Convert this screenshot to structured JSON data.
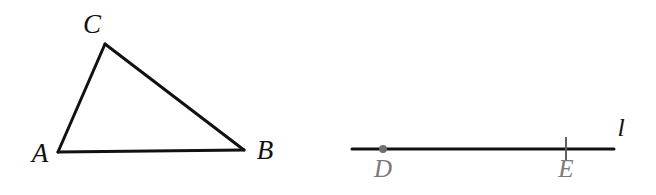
{
  "figure": {
    "caption": "Geometry figure: triangle ABC and line l with points D and E",
    "background_color": "#ffffff",
    "stroke_color": "#111111",
    "gray_color": "#7a7a7a",
    "triangle": {
      "name": "triangle-abc",
      "stroke_width": 3,
      "vertices": [
        {
          "label": "A",
          "x": 58,
          "y": 152,
          "label_x": 40,
          "label_y": 156
        },
        {
          "label": "B",
          "x": 244,
          "y": 150,
          "label_x": 265,
          "label_y": 153
        },
        {
          "label": "C",
          "x": 105,
          "y": 44,
          "label_x": 92,
          "label_y": 27
        }
      ],
      "edges": [
        {
          "name": "segment-ca",
          "from": "C",
          "to": "A"
        },
        {
          "name": "segment-cb",
          "from": "C",
          "to": "B"
        },
        {
          "name": "segment-ab",
          "from": "A",
          "to": "B"
        }
      ]
    },
    "line": {
      "name": "line-l",
      "label": "l",
      "label_x": 621,
      "label_y": 130,
      "stroke_width": 3,
      "x1": 352,
      "y1": 149,
      "x2": 614,
      "y2": 149,
      "points": [
        {
          "label": "D",
          "marker": "dot",
          "x": 383,
          "y": 149,
          "radius": 4,
          "label_x": 383,
          "label_y": 171
        },
        {
          "label": "E",
          "marker": "tick",
          "x": 566,
          "y": 149,
          "tick_top": 137,
          "tick_bottom": 161,
          "label_x": 566,
          "label_y": 171
        }
      ]
    }
  }
}
